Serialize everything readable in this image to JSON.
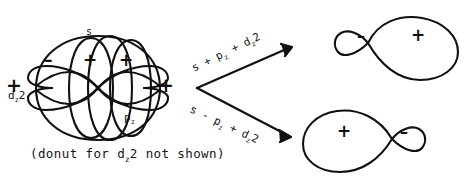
{
  "figure": {
    "title_text": "",
    "background_color": "#ffffff",
    "ink_color": "#111111"
  },
  "orbital_superposition": {
    "caption": "(donut for d z2 not shown)",
    "caption_parts": {
      "before": "(donut for d",
      "subscript": "z",
      "after": "2 not shown)"
    },
    "labels": {
      "s": "s",
      "d_base": "d",
      "d_sub": "z",
      "d_sup": "2",
      "p_base": "p",
      "p_sub": "z"
    },
    "signs": {
      "far_left": "+",
      "far_right": "+",
      "top_left_lobe": "–",
      "top_middle_lobe": "+",
      "top_right_lobe": "+"
    }
  },
  "arrows": {
    "top": {
      "label_parts": [
        "s",
        "+",
        "p",
        "z",
        "+",
        "d",
        "z",
        "2"
      ],
      "label_text": "s + p z + d z2",
      "direction": "up-right"
    },
    "bottom": {
      "label_parts": [
        "s",
        "-",
        "p",
        "z",
        "+",
        "d",
        "z",
        "2"
      ],
      "label_text": "s - p z + d z2",
      "direction": "down-right"
    }
  },
  "hybrid_top_right": {
    "small_lobe_sign": "–",
    "large_lobe_sign": "+",
    "small_lobe_side": "left",
    "large_lobe_side": "right"
  },
  "hybrid_bottom_right": {
    "large_lobe_sign": "+",
    "small_lobe_sign": "–",
    "large_lobe_side": "left",
    "small_lobe_side": "right"
  }
}
